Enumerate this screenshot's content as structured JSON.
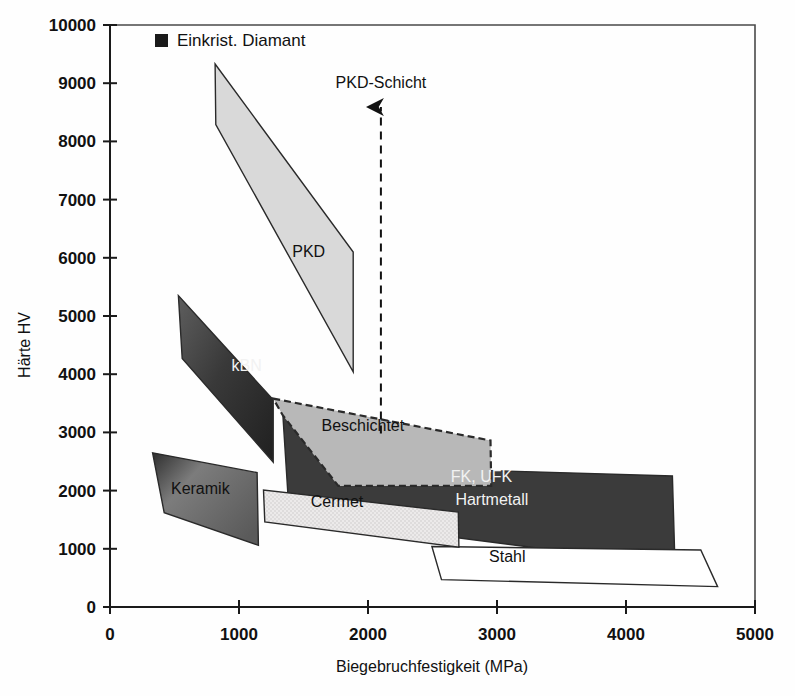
{
  "chart_data": {
    "type": "area",
    "title": "",
    "xlabel": "Biegebruchfestigkeit (MPa)",
    "ylabel": "Härte HV",
    "xlim": [
      0,
      5000
    ],
    "ylim": [
      0,
      10000
    ],
    "xticks": [
      0,
      1000,
      2000,
      3000,
      4000,
      5000
    ],
    "yticks": [
      0,
      1000,
      2000,
      3000,
      4000,
      5000,
      6000,
      7000,
      8000,
      9000,
      10000
    ],
    "xtick_labels": [
      "0",
      "1000",
      "2000",
      "3000",
      "4000",
      "5000"
    ],
    "ytick_labels": [
      "0",
      "1000",
      "2000",
      "3000",
      "4000",
      "5000",
      "6000",
      "7000",
      "8000",
      "9000",
      "10000"
    ],
    "grid": false,
    "legend": {
      "position": "top-left-inside",
      "entries": [
        {
          "label": "Einkrist. Diamant",
          "marker": "filled-square",
          "color": "#1a1a1a"
        }
      ]
    },
    "annotations": [
      {
        "name": "pkd-schicht",
        "text": "PKD-Schicht",
        "text_x": 2100,
        "text_y": 8920,
        "arrow": {
          "x": 2100,
          "y_from": 2980,
          "y_to": 8590,
          "style": "dashed",
          "head": "up"
        }
      }
    ],
    "regions": [
      {
        "name": "PKD",
        "label": "PKD",
        "label_x": 1540,
        "label_y": 6020,
        "label_color": "dark",
        "fill": "#d9d9d9",
        "fill_style": "solid",
        "stroke": "#2a2a2a",
        "stroke_style": "solid",
        "points": [
          [
            815,
            9330
          ],
          [
            820,
            8290
          ],
          [
            1885,
            4040
          ],
          [
            1885,
            6100
          ]
        ]
      },
      {
        "name": "kBN",
        "label": "kBN",
        "label_x": 1060,
        "label_y": 4050,
        "label_color": "light",
        "fill": "#3b3b3b",
        "fill_style": "gradient-dark",
        "stroke": "#2a2a2a",
        "stroke_style": "solid",
        "points": [
          [
            530,
            5350
          ],
          [
            560,
            4270
          ],
          [
            1265,
            2490
          ],
          [
            1265,
            3560
          ]
        ]
      },
      {
        "name": "Beschichtet",
        "label": "Beschichtet",
        "label_x": 1960,
        "label_y": 3030,
        "label_color": "dark",
        "fill": "#b8b8b8",
        "fill_style": "solid",
        "stroke": "#2a2a2a",
        "stroke_style": "dashed",
        "points": [
          [
            1265,
            3580
          ],
          [
            2950,
            2860
          ],
          [
            2955,
            2080
          ],
          [
            1770,
            2080
          ],
          [
            1340,
            3290
          ]
        ]
      },
      {
        "name": "Keramik",
        "label": "Keramik",
        "label_x": 700,
        "label_y": 1950,
        "label_color": "dark",
        "fill": "#808080",
        "fill_style": "gradient-mid",
        "stroke": "#2a2a2a",
        "stroke_style": "solid",
        "points": [
          [
            330,
            2650
          ],
          [
            420,
            1620
          ],
          [
            1150,
            1060
          ],
          [
            1140,
            2310
          ]
        ]
      },
      {
        "name": "Cermet",
        "label": "Cermet",
        "label_x": 1760,
        "label_y": 1720,
        "label_color": "dark",
        "fill": "#e4e4e4",
        "fill_style": "stipple",
        "stroke": "#2a2a2a",
        "stroke_style": "solid",
        "points": [
          [
            1190,
            2010
          ],
          [
            1200,
            1460
          ],
          [
            2705,
            1030
          ],
          [
            2700,
            1630
          ]
        ]
      },
      {
        "name": "Hartmetall",
        "label": "Hartmetall",
        "label_x": 2960,
        "label_y": 1760,
        "label_color": "light",
        "sublabel": "FK, UFK",
        "sublabel_x": 2880,
        "sublabel_y": 2140,
        "fill": "#3b3b3b",
        "fill_style": "solid",
        "stroke": "#2a2a2a",
        "stroke_style": "solid",
        "points": [
          [
            1340,
            3290
          ],
          [
            2100,
            2400
          ],
          [
            4360,
            2250
          ],
          [
            4380,
            710
          ],
          [
            1390,
            1560
          ]
        ]
      },
      {
        "name": "Stahl",
        "label": "Stahl",
        "label_x": 3080,
        "label_y": 780,
        "label_color": "dark",
        "fill": "#ffffff",
        "fill_style": "none",
        "stroke": "#1a1a1a",
        "stroke_style": "solid",
        "points": [
          [
            2495,
            1040
          ],
          [
            2570,
            470
          ],
          [
            4710,
            350
          ],
          [
            4580,
            980
          ]
        ]
      }
    ],
    "region_draw_order": [
      "PKD",
      "kBN",
      "Keramik",
      "Hartmetall",
      "Beschichtet",
      "Stahl",
      "Cermet"
    ]
  },
  "colors": {
    "background": "#fefefe",
    "axis": "#1a1a1a",
    "frame": "#4a4a4a",
    "text": "#111111",
    "text_light": "#f2f2f2"
  }
}
